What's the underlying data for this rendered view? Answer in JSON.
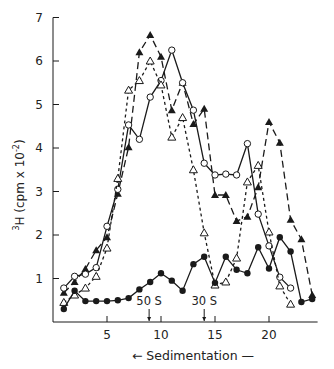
{
  "chart_data": {
    "type": "line",
    "title": "",
    "xlabel": "Sedimentation",
    "xlabel_arrow": "←",
    "xlabel_suffix": "—",
    "ylabel": "³H (cpm × 10⁻²)",
    "ylabel_parts": {
      "sup_pre": "3",
      "main": "H (cpm x 10",
      "sup_exp": "-2",
      "close": ")"
    },
    "xlim": [
      0,
      24.5
    ],
    "ylim": [
      0,
      7
    ],
    "x_ticks": [
      5,
      10,
      15,
      20
    ],
    "x_tick_labels": [
      "5",
      "10",
      "15",
      "20"
    ],
    "y_ticks": [
      1,
      2,
      3,
      4,
      5,
      6,
      7
    ],
    "y_tick_labels": [
      "1",
      "2",
      "3",
      "4",
      "5",
      "6",
      "7"
    ],
    "grid": false,
    "legend": null,
    "annotations": [
      {
        "text": "50 S",
        "x": 8.9
      },
      {
        "text": "30 S",
        "x": 14.0
      }
    ],
    "series": [
      {
        "name": "filled-triangle",
        "marker": "filled-triangle",
        "line": "long-dash",
        "x": [
          1,
          2,
          3,
          4,
          5,
          6,
          7,
          8,
          9,
          10,
          11,
          12,
          13,
          14,
          15,
          16,
          17,
          18,
          19,
          20,
          21,
          22,
          23,
          24
        ],
        "values": [
          0.67,
          0.92,
          1.22,
          1.65,
          1.95,
          2.95,
          4.02,
          6.2,
          6.6,
          6.1,
          4.87,
          5.5,
          4.55,
          4.9,
          2.92,
          2.92,
          2.32,
          2.42,
          3.1,
          4.6,
          4.12,
          2.35,
          1.9,
          0.62
        ]
      },
      {
        "name": "open-circle",
        "marker": "open-circle",
        "line": "solid",
        "x": [
          1,
          2,
          3,
          4,
          5,
          6,
          7,
          8,
          9,
          10,
          11,
          12,
          13,
          14,
          15,
          16,
          17,
          18,
          19,
          20,
          21,
          22
        ],
        "values": [
          0.78,
          1.05,
          1.1,
          1.25,
          2.2,
          3.05,
          4.53,
          4.2,
          5.17,
          5.55,
          6.25,
          5.5,
          4.87,
          3.65,
          3.38,
          3.4,
          3.38,
          4.1,
          2.48,
          1.75,
          1.03,
          0.78
        ]
      },
      {
        "name": "open-triangle",
        "marker": "open-triangle",
        "line": "short-dash",
        "x": [
          1,
          2,
          3,
          4,
          5,
          6,
          7,
          8,
          9,
          10,
          11,
          12,
          13,
          14,
          15,
          16,
          17,
          18,
          19,
          20,
          21,
          22
        ],
        "values": [
          0.45,
          0.62,
          0.78,
          1.05,
          1.7,
          3.3,
          5.33,
          5.55,
          6.0,
          5.45,
          4.25,
          4.7,
          3.5,
          2.05,
          0.85,
          0.92,
          1.47,
          3.22,
          3.6,
          2.07,
          0.83,
          0.41
        ]
      },
      {
        "name": "filled-circle",
        "marker": "filled-circle",
        "line": "solid",
        "x": [
          1,
          2,
          3,
          4,
          5,
          6,
          7,
          8,
          9,
          10,
          11,
          12,
          13,
          14,
          15,
          16,
          17,
          18,
          19,
          20,
          21,
          22,
          23,
          24
        ],
        "values": [
          0.3,
          0.72,
          0.48,
          0.48,
          0.48,
          0.5,
          0.55,
          0.75,
          0.92,
          1.12,
          0.95,
          0.72,
          1.33,
          1.5,
          0.9,
          1.5,
          1.2,
          1.12,
          1.72,
          1.23,
          1.95,
          1.62,
          0.46,
          0.53
        ]
      }
    ]
  },
  "colors": {
    "ink": "#1a1a1a",
    "background": "#ffffff"
  }
}
